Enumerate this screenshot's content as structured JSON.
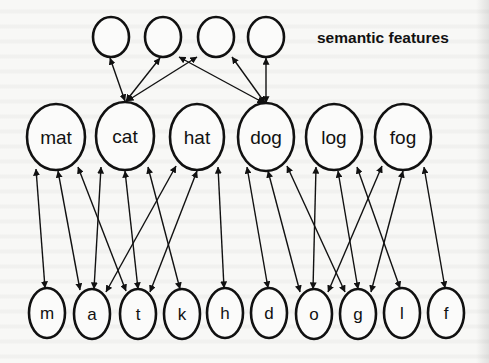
{
  "caption": "semantic features",
  "colors": {
    "stroke": "#111111",
    "background": "#f7f7f5",
    "node_fill": "#fbfbfa"
  },
  "layers": {
    "semantic": [
      {
        "id": "s1",
        "label": "",
        "cx": 111,
        "cy": 37,
        "rx": 18,
        "ry": 20
      },
      {
        "id": "s2",
        "label": "",
        "cx": 163,
        "cy": 37,
        "rx": 18,
        "ry": 20
      },
      {
        "id": "s3",
        "label": "",
        "cx": 216,
        "cy": 37,
        "rx": 18,
        "ry": 20
      },
      {
        "id": "s4",
        "label": "",
        "cx": 266,
        "cy": 37,
        "rx": 18,
        "ry": 20
      }
    ],
    "words": [
      {
        "id": "mat",
        "label": "mat",
        "cx": 56,
        "cy": 137,
        "rx": 29,
        "ry": 33
      },
      {
        "id": "cat",
        "label": "cat",
        "cx": 125,
        "cy": 136,
        "rx": 29,
        "ry": 34
      },
      {
        "id": "hat",
        "label": "hat",
        "cx": 197,
        "cy": 137,
        "rx": 27,
        "ry": 33
      },
      {
        "id": "dog",
        "label": "dog",
        "cx": 266,
        "cy": 137,
        "rx": 28,
        "ry": 34
      },
      {
        "id": "log",
        "label": "log",
        "cx": 334,
        "cy": 137,
        "rx": 28,
        "ry": 33
      },
      {
        "id": "fog",
        "label": "fog",
        "cx": 403,
        "cy": 137,
        "rx": 28,
        "ry": 33
      }
    ],
    "letters": [
      {
        "id": "m",
        "label": "m",
        "cx": 47,
        "cy": 313,
        "rx": 18,
        "ry": 25
      },
      {
        "id": "a",
        "label": "a",
        "cx": 92,
        "cy": 314,
        "rx": 18,
        "ry": 25
      },
      {
        "id": "t",
        "label": "t",
        "cx": 138,
        "cy": 314,
        "rx": 18,
        "ry": 25
      },
      {
        "id": "k",
        "label": "k",
        "cx": 182,
        "cy": 314,
        "rx": 18,
        "ry": 25
      },
      {
        "id": "h",
        "label": "h",
        "cx": 225,
        "cy": 313,
        "rx": 18,
        "ry": 25
      },
      {
        "id": "d",
        "label": "d",
        "cx": 269,
        "cy": 313,
        "rx": 18,
        "ry": 25
      },
      {
        "id": "o",
        "label": "o",
        "cx": 314,
        "cy": 314,
        "rx": 18,
        "ry": 25
      },
      {
        "id": "g",
        "label": "g",
        "cx": 358,
        "cy": 314,
        "rx": 18,
        "ry": 25
      },
      {
        "id": "l",
        "label": "l",
        "cx": 402,
        "cy": 313,
        "rx": 18,
        "ry": 25
      },
      {
        "id": "f",
        "label": "f",
        "cx": 446,
        "cy": 313,
        "rx": 18,
        "ry": 25
      }
    ]
  },
  "edges": [
    {
      "from": "cat",
      "to": "s1",
      "x1": 125,
      "y1": 101,
      "x2": 110,
      "y2": 58,
      "bidirectional": true
    },
    {
      "from": "cat",
      "to": "s2",
      "x1": 126,
      "y1": 101,
      "x2": 160,
      "y2": 58,
      "bidirectional": true
    },
    {
      "from": "cat",
      "to": "s3",
      "x1": 127,
      "y1": 101,
      "x2": 197,
      "y2": 57,
      "bidirectional": true
    },
    {
      "from": "dog",
      "to": "s2",
      "x1": 264,
      "y1": 103,
      "x2": 179,
      "y2": 57,
      "bidirectional": true
    },
    {
      "from": "dog",
      "to": "s3",
      "x1": 265,
      "y1": 103,
      "x2": 232,
      "y2": 57,
      "bidirectional": true
    },
    {
      "from": "dog",
      "to": "s4",
      "x1": 266,
      "y1": 103,
      "x2": 266,
      "y2": 58,
      "bidirectional": true
    },
    {
      "from": "mat",
      "to": "m",
      "x1": 36,
      "y1": 169,
      "x2": 45,
      "y2": 288,
      "bidirectional": true
    },
    {
      "from": "mat",
      "to": "a",
      "x1": 58,
      "y1": 171,
      "x2": 80,
      "y2": 290,
      "bidirectional": true
    },
    {
      "from": "mat",
      "to": "t",
      "x1": 78,
      "y1": 167,
      "x2": 126,
      "y2": 291,
      "bidirectional": true
    },
    {
      "from": "cat",
      "to": "a",
      "x1": 101,
      "y1": 167,
      "x2": 94,
      "y2": 289,
      "bidirectional": true
    },
    {
      "from": "cat",
      "to": "t",
      "x1": 125,
      "y1": 171,
      "x2": 138,
      "y2": 289,
      "bidirectional": true
    },
    {
      "from": "cat",
      "to": "k",
      "x1": 148,
      "y1": 167,
      "x2": 180,
      "y2": 289,
      "bidirectional": true
    },
    {
      "from": "hat",
      "to": "a",
      "x1": 176,
      "y1": 166,
      "x2": 106,
      "y2": 292,
      "bidirectional": true
    },
    {
      "from": "hat",
      "to": "t",
      "x1": 197,
      "y1": 171,
      "x2": 150,
      "y2": 292,
      "bidirectional": true
    },
    {
      "from": "hat",
      "to": "h",
      "x1": 218,
      "y1": 167,
      "x2": 224,
      "y2": 288,
      "bidirectional": true
    },
    {
      "from": "dog",
      "to": "d",
      "x1": 247,
      "y1": 167,
      "x2": 268,
      "y2": 288,
      "bidirectional": true
    },
    {
      "from": "dog",
      "to": "o",
      "x1": 268,
      "y1": 171,
      "x2": 300,
      "y2": 292,
      "bidirectional": true
    },
    {
      "from": "dog",
      "to": "g",
      "x1": 287,
      "y1": 166,
      "x2": 345,
      "y2": 292,
      "bidirectional": true
    },
    {
      "from": "log",
      "to": "o",
      "x1": 316,
      "y1": 167,
      "x2": 313,
      "y2": 289,
      "bidirectional": true
    },
    {
      "from": "log",
      "to": "g",
      "x1": 338,
      "y1": 171,
      "x2": 358,
      "y2": 289,
      "bidirectional": true
    },
    {
      "from": "log",
      "to": "l",
      "x1": 357,
      "y1": 167,
      "x2": 400,
      "y2": 288,
      "bidirectional": true
    },
    {
      "from": "fog",
      "to": "o",
      "x1": 382,
      "y1": 166,
      "x2": 328,
      "y2": 292,
      "bidirectional": true
    },
    {
      "from": "fog",
      "to": "g",
      "x1": 403,
      "y1": 171,
      "x2": 371,
      "y2": 292,
      "bidirectional": true
    },
    {
      "from": "fog",
      "to": "f",
      "x1": 424,
      "y1": 167,
      "x2": 445,
      "y2": 288,
      "bidirectional": true
    }
  ]
}
